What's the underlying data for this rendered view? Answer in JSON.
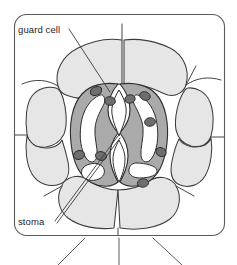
{
  "figure": {
    "frame": {
      "name": "rounded-rectangle-border",
      "x": 14,
      "y": 14,
      "width": 211,
      "height": 222,
      "corner_radius": 12,
      "stroke": "#5a5a5a",
      "fill": "#ffffff"
    },
    "labels": [
      {
        "id": "guard-cell",
        "text": "guard cell",
        "x": 18,
        "y": 33,
        "anchor": "start",
        "leader_line": {
          "x1": 69,
          "y1": 29,
          "x2": 110,
          "y2": 92
        }
      },
      {
        "id": "stoma",
        "text": "stoma",
        "x": 18,
        "y": 225,
        "anchor": "start",
        "leader_line": {
          "x1": 55,
          "y1": 221,
          "x2": 118,
          "y2": 136
        }
      }
    ],
    "colors": {
      "epidermal_cell_fill": "#e6e6e6",
      "epidermal_cell_stroke": "#3c3c3c",
      "guard_cell_fill": "#aaaaaa",
      "guard_cell_stroke": "#2e2e2e",
      "vacuole_fill": "#ffffff",
      "chloroplast_fill": "#6e6e6e",
      "chloroplast_stroke": "#2a2a2a",
      "pore_fill": "#ffffff",
      "leader_line": "#3a3a3a",
      "label_text": "#1d1d1d",
      "background": "#ffffff"
    },
    "structures": {
      "epidermal_cells_count": 8,
      "guard_cells_count": 2,
      "chloroplasts_left": 4,
      "chloroplasts_right": 5,
      "stomatal_pore": 1,
      "external_lines_bottom": 3,
      "external_lines_side": 2
    }
  }
}
